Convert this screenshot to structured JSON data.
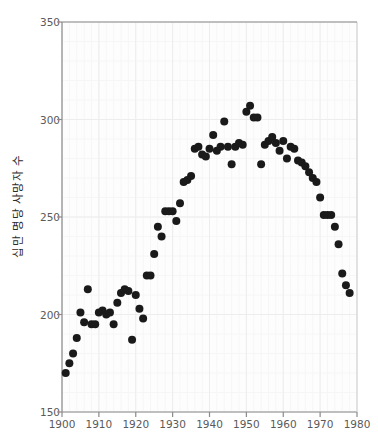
{
  "chart_data": {
    "type": "scatter",
    "title": "",
    "xlabel": "",
    "ylabel": "십만 명당 사망자 수",
    "xlim": [
      1900,
      1980
    ],
    "ylim": [
      150,
      350
    ],
    "xticks": [
      1900,
      1910,
      1920,
      1930,
      1940,
      1950,
      1960,
      1970,
      1980
    ],
    "yticks": [
      150,
      200,
      250,
      300,
      350
    ],
    "xtick_labels": [
      "1900",
      "1910",
      "1920",
      "1930",
      "1940",
      "1950",
      "1960",
      "1970",
      "1980"
    ],
    "ytick_labels": [
      "150",
      "200",
      "250",
      "300",
      "350"
    ],
    "grid": true,
    "grid_color": "#f0f0f0",
    "legend": null,
    "marker": "circle",
    "marker_color": "#1a1a1a",
    "marker_size": 4,
    "x": [
      1901,
      1902,
      1903,
      1904,
      1905,
      1906,
      1907,
      1908,
      1909,
      1910,
      1911,
      1912,
      1913,
      1914,
      1915,
      1916,
      1917,
      1918,
      1919,
      1920,
      1921,
      1922,
      1923,
      1924,
      1925,
      1926,
      1927,
      1928,
      1929,
      1930,
      1931,
      1932,
      1933,
      1934,
      1935,
      1936,
      1937,
      1938,
      1939,
      1940,
      1941,
      1942,
      1943,
      1944,
      1945,
      1946,
      1947,
      1948,
      1949,
      1950,
      1951,
      1952,
      1953,
      1954,
      1955,
      1956,
      1957,
      1958,
      1959,
      1960,
      1961,
      1962,
      1963,
      1964,
      1965,
      1966,
      1967,
      1968,
      1969,
      1970,
      1971,
      1972,
      1973,
      1974,
      1975,
      1976,
      1977,
      1978
    ],
    "y": [
      170,
      175,
      180,
      188,
      201,
      196,
      213,
      195,
      195,
      201,
      202,
      200,
      201,
      195,
      206,
      211,
      213,
      212,
      187,
      210,
      203,
      198,
      220,
      220,
      231,
      245,
      240,
      253,
      253,
      253,
      248,
      257,
      268,
      269,
      271,
      285,
      286,
      282,
      281,
      285,
      292,
      284,
      286,
      299,
      286,
      277,
      286,
      288,
      287,
      304,
      307,
      301,
      301,
      277,
      287,
      289,
      291,
      288,
      284,
      289,
      280,
      286,
      285,
      279,
      278,
      276,
      273,
      270,
      268,
      260,
      251,
      251,
      251,
      245,
      236,
      221,
      215,
      211
    ]
  }
}
